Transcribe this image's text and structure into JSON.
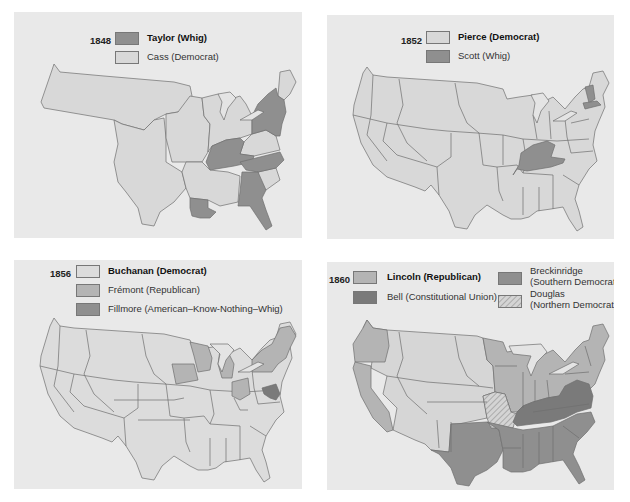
{
  "colors": {
    "panel_bg": "#e9e9e9",
    "light": "#d8d8d8",
    "light_alt": "#dcdcdc",
    "mid": "#b4b4b4",
    "dark": "#8f8f8f",
    "darker": "#7a7a7a",
    "lakes": "#e4e4e4",
    "outline": "#6f6f6f"
  },
  "panels": [
    {
      "year": "1848",
      "legend": [
        {
          "label": "Taylor (Whig)",
          "bold": true,
          "swatch": "dark"
        },
        {
          "label": "Cass (Democrat)",
          "bold": false,
          "swatch": "light"
        }
      ]
    },
    {
      "year": "1852",
      "legend": [
        {
          "label": "Pierce (Democrat)",
          "bold": true,
          "swatch": "light"
        },
        {
          "label": "Scott (Whig)",
          "bold": false,
          "swatch": "dark"
        }
      ]
    },
    {
      "year": "1856",
      "legend": [
        {
          "label": "Buchanan (Democrat)",
          "bold": true,
          "swatch": "light"
        },
        {
          "label": "Frémont (Republican)",
          "bold": false,
          "swatch": "mid"
        },
        {
          "label": "Fillmore (American–Know-Nothing–Whig)",
          "bold": false,
          "swatch": "dark"
        }
      ]
    },
    {
      "year": "1860",
      "legend": [
        {
          "label": "Lincoln (Republican)",
          "bold": true,
          "swatch": "mid"
        },
        {
          "label": "Bell (Constitutional Union)",
          "bold": false,
          "swatch": "darker"
        },
        {
          "label_line1": "Breckinridge",
          "label_line2": "(Southern Democrat)",
          "bold": false,
          "swatch": "dark"
        },
        {
          "label_line1": "Douglas",
          "label_line2": "(Northern Democrat)",
          "bold": false,
          "swatch": "hatched"
        }
      ]
    }
  ]
}
